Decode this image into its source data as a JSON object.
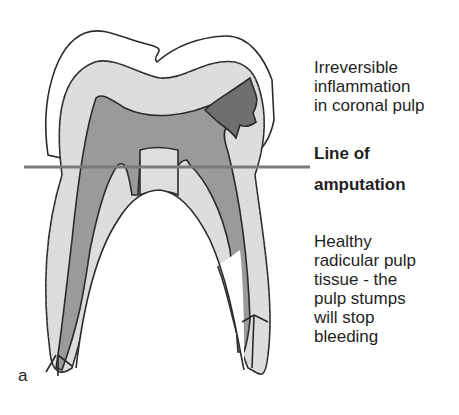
{
  "figure": {
    "panel_letter": "a",
    "labels": {
      "inflammation": [
        "Irreversible",
        "inflammation",
        "in coronal pulp"
      ],
      "amputation_top": "Line of",
      "amputation_bottom": "amputation",
      "healthy": [
        "Healthy",
        "radicular pulp",
        "tissue - the",
        "pulp stumps",
        "will stop",
        "bleeding"
      ]
    },
    "colors": {
      "enamel": "#ffffff",
      "dentine": "#dedede",
      "pulp": "#9a9a9a",
      "inflamed_pulp": "#6f6f6f",
      "outline": "#2b2b2b",
      "amputation_line": "#7a7a7a"
    }
  }
}
